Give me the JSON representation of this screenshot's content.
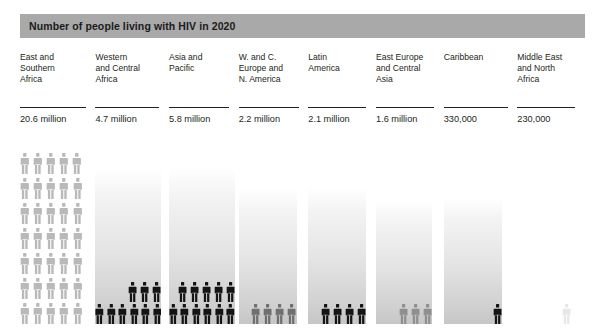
{
  "title": "Number of people living with HIV in 2020",
  "chart_data": {
    "type": "bar",
    "title": "Number of people living with HIV in 2020",
    "xlabel": "",
    "ylabel": "",
    "unit_note": "Each figure icon represents a share of the regional total; bar height is proportional to the value.",
    "categories": [
      "East and\nSouthern\nAfrica",
      "Western\nand Central\nAfrica",
      "Asia and\nPacific",
      "W. and C.\nEurope and\nN. America",
      "Latin\nAmerica",
      "East Europe\nand Central\nAsia",
      "Caribbean",
      "Middle East\nand North\nAfrica"
    ],
    "value_labels": [
      "20.6 million",
      "4.7 million",
      "5.8 million",
      "2.2 million",
      "2.1 million",
      "1.6 million",
      "330,000",
      "230,000"
    ],
    "values": [
      20600000,
      4700000,
      5800000,
      2200000,
      2100000,
      1600000,
      330000,
      230000
    ],
    "icon_counts": [
      35,
      9,
      11,
      4,
      4,
      3,
      1,
      1
    ],
    "grid": false,
    "legend": false
  },
  "columns": [
    {
      "region": "East and\nSouthern\nAfrica",
      "value": "20.6 million",
      "bar_height_px": 0,
      "bar_width_px": 62,
      "bar_kind": "none",
      "rows": [
        {
          "count": 5,
          "tone": "tone-light",
          "align": "right"
        },
        {
          "count": 5,
          "tone": "tone-light",
          "align": "left"
        },
        {
          "count": 5,
          "tone": "tone-light",
          "align": "left"
        },
        {
          "count": 5,
          "tone": "tone-light",
          "align": "left"
        },
        {
          "count": 5,
          "tone": "tone-light",
          "align": "left"
        },
        {
          "count": 5,
          "tone": "tone-light",
          "align": "left"
        },
        {
          "count": 5,
          "tone": "tone-light",
          "align": "left"
        }
      ]
    },
    {
      "region": "Western\nand Central\nAfrica",
      "value": "4.7 million",
      "bar_height_px": 155,
      "bar_width_px": 66,
      "bar_kind": "grad",
      "rows": [
        {
          "count": 3,
          "tone": "tone-dark",
          "align": "right"
        },
        {
          "count": 6,
          "tone": "tone-dark",
          "align": "left"
        }
      ]
    },
    {
      "region": "Asia and\nPacific",
      "value": "5.8 million",
      "bar_height_px": 156,
      "bar_width_px": 66,
      "bar_kind": "grad",
      "rows": [
        {
          "count": 5,
          "tone": "tone-dark",
          "align": "right"
        },
        {
          "count": 6,
          "tone": "tone-dark",
          "align": "left"
        }
      ]
    },
    {
      "region": "W. and C.\nEurope and\nN. America",
      "value": "2.2 million",
      "bar_height_px": 136,
      "bar_width_px": 58,
      "bar_kind": "grad",
      "rows": [
        {
          "count": 4,
          "tone": "tone-mid",
          "align": "right"
        }
      ]
    },
    {
      "region": "Latin\nAmerica",
      "value": "2.1 million",
      "bar_height_px": 137,
      "bar_width_px": 58,
      "bar_kind": "grad",
      "rows": [
        {
          "count": 4,
          "tone": "tone-dark",
          "align": "right"
        }
      ]
    },
    {
      "region": "East Europe\nand Central\nAsia",
      "value": "1.6 million",
      "bar_height_px": 123,
      "bar_width_px": 56,
      "bar_kind": "grad",
      "rows": [
        {
          "count": 3,
          "tone": "tone-gray",
          "align": "right"
        }
      ]
    },
    {
      "region": "Caribbean",
      "value": "330,000",
      "bar_height_px": 127,
      "bar_width_px": 58,
      "bar_kind": "grad",
      "rows": [
        {
          "count": 1,
          "tone": "tone-dark",
          "align": "right"
        }
      ]
    },
    {
      "region": "Middle East\nand North\nAfrica",
      "value": "230,000",
      "bar_height_px": 0,
      "bar_width_px": 54,
      "bar_kind": "none",
      "rows": [
        {
          "count": 1,
          "tone": "tone-faint",
          "align": "right"
        }
      ]
    }
  ],
  "colors": {
    "title_bar": "#a9a9a9",
    "title_text": "#1b1b1b",
    "text": "#231f20",
    "figure_dark": "#141414",
    "figure_mid": "#6f6f6f",
    "figure_gray": "#8f8f8f",
    "figure_light": "#b9b9b9",
    "figure_faint": "#e7e7e7",
    "background": "#ffffff"
  }
}
